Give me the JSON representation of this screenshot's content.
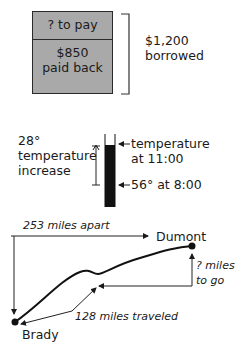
{
  "loan_diagram": {
    "to_pay_label": "? to pay",
    "paid_amount": "$850",
    "paid_label": "paid back",
    "total_amount": "$1,200",
    "total_label": "borrowed",
    "box_color": "#a9a9a9"
  },
  "thermometer_diagram": {
    "increase_amount": "28°",
    "increase_label_line1": "temperature",
    "increase_label_line2": "increase",
    "top_label_line1": "temperature",
    "top_label_line2": "at 11:00",
    "bottom_label": "56° at 8:00",
    "fill_color": "#111111"
  },
  "route_diagram": {
    "total_distance_label": "253 miles apart",
    "start_city": "Brady",
    "end_city": "Dumont",
    "remaining_label_line1": "? miles",
    "remaining_label_line2": "to go",
    "traveled_label": "128 miles traveled"
  }
}
